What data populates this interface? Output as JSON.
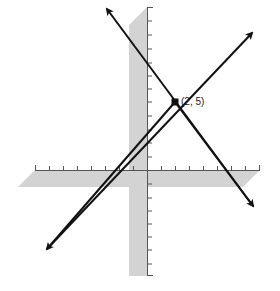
{
  "diagram": {
    "type": "coordinate-plane",
    "colors": {
      "background": "#ffffff",
      "shadow": "#d3d3d3",
      "axis": "#555555",
      "line": "#111111",
      "point": "#111111"
    },
    "axes": {
      "x_ticks_negative": 8,
      "x_ticks_positive": 8,
      "y_ticks_positive": 12,
      "y_ticks_negative": 8,
      "unit_px": 14
    },
    "lines": [
      {
        "name": "decreasing-line",
        "slope_sign": "negative",
        "passes_through": [
          2,
          5
        ]
      },
      {
        "name": "increasing-line",
        "slope_sign": "positive",
        "passes_through": [
          2,
          5
        ]
      }
    ],
    "intersection": {
      "x": 2,
      "y": 5,
      "label": "(2, 5)"
    }
  }
}
